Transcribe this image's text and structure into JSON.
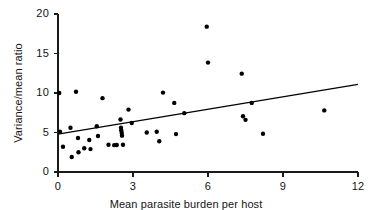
{
  "chart_data": {
    "type": "scatter",
    "title": "",
    "xlabel": "Mean parasite burden per host",
    "ylabel": "Variance/mean ratio",
    "xlim": [
      0,
      12
    ],
    "ylim": [
      0,
      20
    ],
    "xticks": [
      0,
      3,
      6,
      9,
      12
    ],
    "xtick_labels": [
      "0",
      "3",
      "6",
      "9",
      "12"
    ],
    "yticks": [
      0,
      5,
      10,
      15,
      20
    ],
    "ytick_labels": [
      "0",
      "5",
      "10",
      "15",
      "20"
    ],
    "grid": false,
    "legend": null,
    "marker": {
      "shape": "circle",
      "color": "#000000",
      "size_px": 4.4
    },
    "points": [
      [
        0.05,
        10.0
      ],
      [
        0.08,
        5.1
      ],
      [
        0.2,
        3.2
      ],
      [
        0.5,
        5.6
      ],
      [
        0.55,
        1.9
      ],
      [
        0.72,
        10.15
      ],
      [
        0.8,
        4.3
      ],
      [
        0.82,
        2.5
      ],
      [
        1.05,
        3.0
      ],
      [
        1.25,
        4.05
      ],
      [
        1.3,
        2.9
      ],
      [
        1.55,
        5.8
      ],
      [
        1.6,
        4.55
      ],
      [
        1.78,
        9.35
      ],
      [
        2.02,
        3.45
      ],
      [
        2.25,
        3.4
      ],
      [
        2.35,
        3.42
      ],
      [
        2.5,
        6.65
      ],
      [
        2.52,
        5.6
      ],
      [
        2.53,
        5.25
      ],
      [
        2.55,
        4.95
      ],
      [
        2.56,
        4.6
      ],
      [
        2.6,
        3.45
      ],
      [
        2.82,
        7.9
      ],
      [
        2.95,
        6.2
      ],
      [
        3.55,
        5.0
      ],
      [
        3.95,
        5.1
      ],
      [
        4.05,
        3.9
      ],
      [
        4.2,
        10.05
      ],
      [
        4.65,
        8.75
      ],
      [
        4.72,
        4.8
      ],
      [
        5.05,
        7.45
      ],
      [
        5.95,
        18.4
      ],
      [
        6.0,
        13.85
      ],
      [
        7.35,
        12.45
      ],
      [
        7.4,
        7.05
      ],
      [
        7.5,
        6.6
      ],
      [
        7.75,
        8.75
      ],
      [
        8.2,
        4.85
      ],
      [
        10.65,
        7.8
      ]
    ],
    "trend_line": {
      "type": "linear-fit",
      "x_start": 0,
      "y_start": 4.8,
      "x_end": 12,
      "y_end": 11.1,
      "color": "#000000"
    },
    "axes": {
      "spine_color": "#1a1a1a",
      "left_spine": true,
      "bottom_spine": true,
      "top_spine": false,
      "right_spine": false,
      "tick_direction": "out"
    }
  }
}
